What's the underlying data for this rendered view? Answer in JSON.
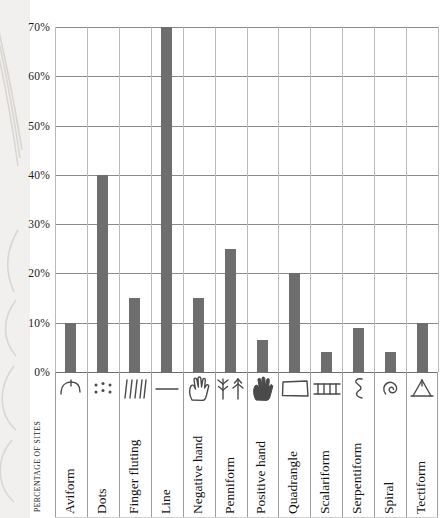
{
  "chart_data": {
    "type": "bar",
    "title": "",
    "xlabel": "",
    "ylabel": "PERCENTAGE OF SITES",
    "ylim": [
      0,
      70
    ],
    "ytick_step": 10,
    "ytick_labels": [
      "0%",
      "10%",
      "20%",
      "30%",
      "40%",
      "50%",
      "60%",
      "70%"
    ],
    "ytick_values": [
      0,
      10,
      20,
      30,
      40,
      50,
      60,
      70
    ],
    "grid": "horizontal-and-vertical",
    "legend": "none",
    "bar_color": "#6e6e6e",
    "gridline_color": "#8a8a8a",
    "vgridline_color": "#b9b9b9",
    "categories": [
      "Aviform",
      "Dots",
      "Finger fluting",
      "Line",
      "Negative hand",
      "Penniform",
      "Positive hand",
      "Quadrangle",
      "Scalariform",
      "Serpentiform",
      "Spiral",
      "Tectiform"
    ],
    "values": [
      10,
      40,
      15,
      70,
      15,
      25,
      6.5,
      20,
      4,
      9,
      4,
      10
    ],
    "icons": [
      "aviform-icon",
      "dots-icon",
      "finger-fluting-icon",
      "line-icon",
      "negative-hand-icon",
      "penniform-icon",
      "positive-hand-icon",
      "quadrangle-icon",
      "scalariform-icon",
      "serpentiform-icon",
      "spiral-icon",
      "tectiform-icon"
    ]
  }
}
